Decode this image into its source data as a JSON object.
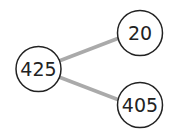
{
  "diagram": {
    "type": "number-bond",
    "whole": {
      "label": "425"
    },
    "parts": [
      {
        "label": "20"
      },
      {
        "label": "405"
      }
    ],
    "colors": {
      "circle_stroke": "#222222",
      "connector": "#aaaaaa",
      "text": "#222222"
    }
  }
}
